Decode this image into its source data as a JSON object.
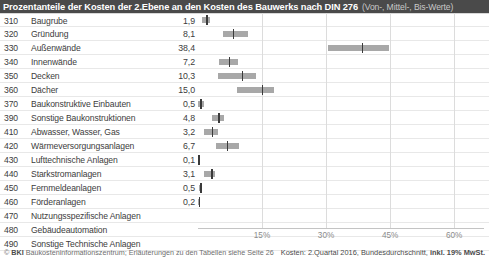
{
  "header": {
    "title_main": "Prozentanteile der Kosten der 2.Ebene an den Kosten des Bauwerks nach DIN 276",
    "title_sub": "(Von-, Mittel-, Bis-Werte)"
  },
  "footer": {
    "copyright_symbol": "©",
    "brand": "BKI",
    "left_text": "Baukosteninformationszentrum; Erläuterungen zu den Tabellen siehe Seite 26",
    "right_prefix": "Kosten: 2.Quartal 2016, Bundesdurchschnitt,",
    "right_strong": "inkl. 19% MwSt."
  },
  "chart_data": {
    "type": "bar",
    "title": "Prozentanteile der Kosten der 2.Ebene an den Kosten des Bauwerks nach DIN 276",
    "subtitle": "(Von-, Mittel-, Bis-Werte)",
    "xlabel": "",
    "ylabel": "",
    "xlim": [
      0,
      67
    ],
    "grid": true,
    "xticks": [
      15,
      30,
      45,
      60
    ],
    "xtick_labels": [
      "15%",
      "30%",
      "45%",
      "60%"
    ],
    "legend": [],
    "series_note": "Each row shows a low (Von), mid (Mittel) and high (Bis) percentage value; the printed number is the mid value.",
    "categories": [
      "310 Baugrube",
      "320 Gründung",
      "330 Außenwände",
      "340 Innenwände",
      "350 Decken",
      "360 Dächer",
      "370 Baukonstruktive Einbauten",
      "390 Sonstige Baukonstruktionen",
      "410 Abwasser, Wasser, Gas",
      "420 Wärmeversorgungsanlagen",
      "430 Lufttechnische Anlagen",
      "440 Starkstromanlagen",
      "450 Fernmeldeanlagen",
      "460 Förderanlagen",
      "470 Nutzungsspezifische Anlagen",
      "480 Gebäudeautomation",
      "490 Sonstige Technische Anlagen"
    ],
    "rows": [
      {
        "code": "310",
        "label": "Baugrube",
        "value": "1,9",
        "mid": 1.9,
        "low": 1.0,
        "high": 2.9
      },
      {
        "code": "320",
        "label": "Gründung",
        "value": "8,1",
        "mid": 8.1,
        "low": 5.8,
        "high": 11.8
      },
      {
        "code": "330",
        "label": "Außenwände",
        "value": "38,4",
        "mid": 38.4,
        "low": 30.5,
        "high": 44.7
      },
      {
        "code": "340",
        "label": "Innenwände",
        "value": "7,2",
        "mid": 7.2,
        "low": 5.0,
        "high": 9.3
      },
      {
        "code": "350",
        "label": "Decken",
        "value": "10,3",
        "mid": 10.3,
        "low": 4.6,
        "high": 13.5
      },
      {
        "code": "360",
        "label": "Dächer",
        "value": "15,0",
        "mid": 15.0,
        "low": 9.2,
        "high": 17.8
      },
      {
        "code": "370",
        "label": "Baukonstruktive Einbauten",
        "value": "0,5",
        "mid": 0.5,
        "low": 0.0,
        "high": 1.3
      },
      {
        "code": "390",
        "label": "Sonstige Baukonstruktionen",
        "value": "4,8",
        "mid": 4.8,
        "low": 3.2,
        "high": 6.1
      },
      {
        "code": "410",
        "label": "Abwasser, Wasser, Gas",
        "value": "3,2",
        "mid": 3.2,
        "low": 1.4,
        "high": 4.6
      },
      {
        "code": "420",
        "label": "Wärmeversorgungsanlagen",
        "value": "6,7",
        "mid": 6.7,
        "low": 4.1,
        "high": 9.6
      },
      {
        "code": "430",
        "label": "Lufttechnische Anlagen",
        "value": "0,1",
        "mid": 0.1,
        "low": 0.0,
        "high": 0.2
      },
      {
        "code": "440",
        "label": "Starkstromanlagen",
        "value": "3,1",
        "mid": 3.1,
        "low": 1.5,
        "high": 4.1
      },
      {
        "code": "450",
        "label": "Fernmeldeanlagen",
        "value": "0,5",
        "mid": 0.5,
        "low": 0.2,
        "high": 0.9
      },
      {
        "code": "460",
        "label": "Förderanlagen",
        "value": "0,2",
        "mid": 0.2,
        "low": 0.0,
        "high": 0.3
      },
      {
        "code": "470",
        "label": "Nutzungsspezifische Anlagen",
        "value": "",
        "mid": null,
        "low": null,
        "high": null
      },
      {
        "code": "480",
        "label": "Gebäudeautomation",
        "value": "",
        "mid": null,
        "low": null,
        "high": null
      },
      {
        "code": "490",
        "label": "Sonstige Technische Anlagen",
        "value": "",
        "mid": null,
        "low": null,
        "high": null
      }
    ]
  }
}
